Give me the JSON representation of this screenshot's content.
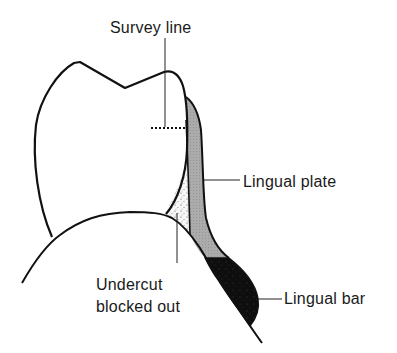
{
  "figure": {
    "labels": {
      "survey_line": "Survey line",
      "lingual_plate": "Lingual plate",
      "undercut_line1": "Undercut",
      "undercut_line2": "blocked out",
      "lingual_bar": "Lingual bar"
    },
    "components": [
      {
        "id": "tooth",
        "name": "Tooth crown outline"
      },
      {
        "id": "gingiva",
        "name": "Gingiva / alveolar ridge outline"
      },
      {
        "id": "survey-line",
        "name": "Survey line (dotted)"
      },
      {
        "id": "lingual-plate",
        "name": "Lingual plate",
        "fill": "#a8a8a8"
      },
      {
        "id": "undercut",
        "name": "Undercut blocked out",
        "fill": "#f2f2f2"
      },
      {
        "id": "lingual-bar",
        "name": "Lingual bar",
        "fill": "#111111"
      }
    ],
    "colors": {
      "stroke": "#111111",
      "plate": "#a8a8a8",
      "bar": "#111111",
      "undercut": "#f4f4f4",
      "background": "#ffffff"
    }
  }
}
